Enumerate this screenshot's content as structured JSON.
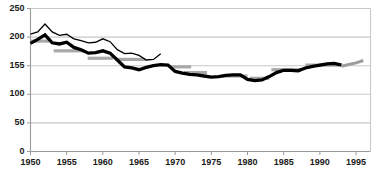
{
  "chart_data": {
    "type": "line",
    "title": "",
    "subtitle": "",
    "xlabel": "",
    "ylabel": "",
    "xlim": [
      1950,
      1997
    ],
    "ylim": [
      0,
      250
    ],
    "grid": true,
    "grid_axis": "y",
    "legend": "none",
    "legend_position": "none",
    "y_ticks": [
      0,
      50,
      100,
      "155",
      200,
      250
    ],
    "y_tick_values": [
      0,
      50,
      100,
      150,
      200,
      250
    ],
    "x_ticks": [
      1950,
      1955,
      1960,
      1965,
      1970,
      1975,
      1980,
      1985,
      1990,
      1995
    ],
    "colors": {
      "thin_line": "#000000",
      "thick_line": "#000000",
      "average_segments": "#a8a8a8",
      "grid": "#c8c8c8",
      "axis": "#9a9a9a",
      "text": "#1a1a1a",
      "background": "#ffffff"
    },
    "series": [
      {
        "name": "thin-line-series",
        "style": "thin",
        "color": "#000000",
        "x": [
          1950,
          1951,
          1952,
          1953,
          1954,
          1955,
          1956,
          1957,
          1958,
          1959,
          1960,
          1961,
          1962,
          1963,
          1964,
          1965,
          1966,
          1967,
          1968
        ],
        "values": [
          205,
          209,
          223,
          209,
          203,
          205,
          197,
          194,
          190,
          191,
          197,
          192,
          178,
          171,
          172,
          168,
          160,
          161,
          171
        ]
      },
      {
        "name": "thick-line-series",
        "style": "thick",
        "color": "#000000",
        "x": [
          1950,
          1951,
          1952,
          1953,
          1954,
          1955,
          1956,
          1957,
          1958,
          1959,
          1960,
          1961,
          1962,
          1963,
          1964,
          1965,
          1966,
          1967,
          1968,
          1969,
          1970,
          1971,
          1972,
          1973,
          1974,
          1975,
          1976,
          1977,
          1978,
          1979,
          1980,
          1981,
          1982,
          1983,
          1984,
          1985,
          1986,
          1987,
          1988,
          1989,
          1990,
          1991,
          1992,
          1993
        ],
        "values": [
          189,
          196,
          204,
          190,
          188,
          191,
          182,
          178,
          172,
          173,
          176,
          172,
          160,
          148,
          146,
          143,
          147,
          150,
          152,
          151,
          140,
          137,
          135,
          134,
          132,
          130,
          131,
          133,
          134,
          134,
          126,
          124,
          125,
          131,
          138,
          142,
          142,
          141,
          146,
          149,
          151,
          153,
          154,
          151
        ]
      },
      {
        "name": "gray-tail-series",
        "style": "thick-gray",
        "color": "#9c9c9c",
        "x": [
          1993,
          1994,
          1995,
          1996
        ],
        "values": [
          149,
          152,
          155,
          159
        ]
      }
    ],
    "average_segments": [
      {
        "name": "avg-1950-1952",
        "x0": 1950,
        "x1": 1952.6,
        "value": 193
      },
      {
        "name": "avg-1953-1957",
        "x0": 1953.2,
        "x1": 1957.4,
        "value": 176
      },
      {
        "name": "avg-1958-1961",
        "x0": 1957.9,
        "x1": 1961.4,
        "value": 163
      },
      {
        "name": "avg-1962-1966",
        "x0": 1962.0,
        "x1": 1965.9,
        "value": 161
      },
      {
        "name": "avg-1967-1971",
        "x0": 1969.4,
        "x1": 1972.2,
        "value": 148
      },
      {
        "name": "avg-1972-1975",
        "x0": 1971.2,
        "x1": 1974.4,
        "value": 138
      },
      {
        "name": "avg-1976-1980",
        "x0": 1976.4,
        "x1": 1980.0,
        "value": 132
      },
      {
        "name": "avg-1981-1983",
        "x0": 1980.3,
        "x1": 1983.0,
        "value": 128
      },
      {
        "name": "avg-1984-1988",
        "x0": 1983.3,
        "x1": 1987.4,
        "value": 143
      },
      {
        "name": "avg-1989-1992",
        "x0": 1988.0,
        "x1": 1992.6,
        "value": 151
      }
    ]
  }
}
